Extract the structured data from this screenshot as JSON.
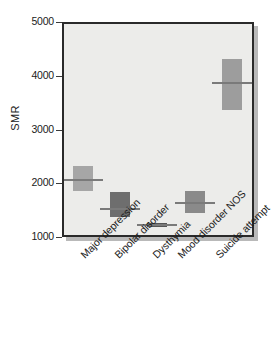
{
  "chart_data": {
    "type": "box",
    "title": "",
    "xlabel": "",
    "ylabel": "SMR",
    "ylim": [
      1000,
      5000
    ],
    "yticks": [
      1000,
      2000,
      3000,
      4000,
      5000
    ],
    "ytick_labels": [
      "1000",
      "2000",
      "3000",
      "4000",
      "5000"
    ],
    "grid": false,
    "legend": null,
    "categories": [
      "Major depression",
      "Bipolar disorder",
      "Dysthymia",
      "Mood disorder NOS",
      "Suicide attempt"
    ],
    "boxes": [
      {
        "category": "Major depression",
        "low": 1840,
        "high": 2320,
        "median": 2060,
        "color": "#a6a6a6"
      },
      {
        "category": "Bipolar disorder",
        "low": 1360,
        "high": 1830,
        "median": 1520,
        "color": "#6e6e6e"
      },
      {
        "category": "Dysthymia",
        "low": 1180,
        "high": 1260,
        "median": 1220,
        "color": "#555555"
      },
      {
        "category": "Mood disorder NOS",
        "low": 1430,
        "high": 1840,
        "median": 1630,
        "color": "#8a8a8a"
      },
      {
        "category": "Suicide attempt",
        "low": 3350,
        "high": 4300,
        "median": 3860,
        "color": "#9d9d9d"
      }
    ]
  },
  "style": {
    "plot_background": "#ececea",
    "frame_color": "#2a2a2a",
    "shadow_color": "#b9b9b9",
    "text_color": "#1b1b1b",
    "median_color": "#7a7a7a"
  }
}
